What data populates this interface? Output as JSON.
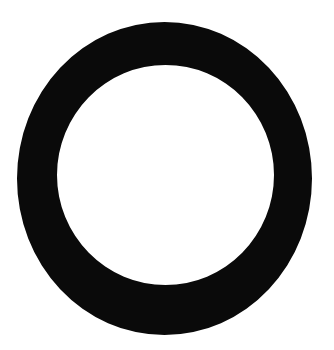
{
  "image": {
    "title": "Black ring",
    "width": 334,
    "height": 350,
    "background_color": "#ffffff",
    "alt_text": "A thick solid black ring (annulus) centered on a plain white background"
  },
  "shapes": [
    {
      "name": "ring",
      "kind": "annulus",
      "fill_color": "#0a0a0a",
      "hole_color": "#ffffff",
      "outer": {
        "cx": 164.5,
        "cy": 178.5,
        "rx": 147.5,
        "ry": 156.5,
        "left": 17,
        "right": 312,
        "top": 22,
        "bottom": 335
      },
      "inner": {
        "cx": 165.5,
        "cy": 175.0,
        "rx": 108.5,
        "ry": 110.0,
        "left": 57,
        "right": 274,
        "top": 65,
        "bottom": 285
      },
      "stroke_thickness_px": 42
    }
  ]
}
